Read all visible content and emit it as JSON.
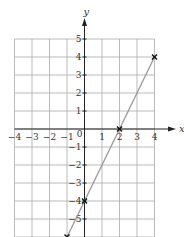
{
  "chart_data": {
    "type": "line",
    "title": "",
    "xlabel": "x",
    "ylabel": "y",
    "xlim": [
      -4,
      4
    ],
    "ylim": [
      -6,
      5
    ],
    "grid": true,
    "x_ticks": [
      "-4",
      "-3",
      "-2",
      "-1",
      "1",
      "2",
      "3",
      "4"
    ],
    "y_ticks": [
      "5",
      "4",
      "3",
      "2",
      "1",
      "-1",
      "-2",
      "-3",
      "-4",
      "-5"
    ],
    "origin_label": "0",
    "series": [
      {
        "name": "y = 2x - 4",
        "x": [
          -1,
          4
        ],
        "y": [
          -6,
          4
        ],
        "color": "#999999"
      }
    ],
    "marked_points": [
      {
        "x": 0,
        "y": -4
      },
      {
        "x": 2,
        "y": 0
      },
      {
        "x": 4,
        "y": 4
      },
      {
        "x": -1,
        "y": -6
      }
    ]
  }
}
